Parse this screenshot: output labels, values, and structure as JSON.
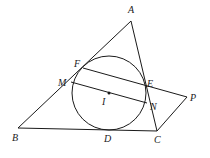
{
  "diagram": {
    "points": {
      "A": {
        "label": "A",
        "x": 131,
        "y": 21
      },
      "B": {
        "label": "B",
        "x": 18,
        "y": 128
      },
      "C": {
        "label": "C",
        "x": 157,
        "y": 131
      },
      "D": {
        "label": "D",
        "x": 112,
        "y": 130
      },
      "E": {
        "label": "E",
        "x": 146,
        "y": 86
      },
      "F": {
        "label": "F",
        "x": 83,
        "y": 68
      },
      "M": {
        "label": "M",
        "x": 71,
        "y": 82
      },
      "N": {
        "label": "N",
        "x": 147,
        "y": 103
      },
      "I": {
        "label": "I",
        "x": 109,
        "y": 93
      },
      "P": {
        "label": "P",
        "x": 187,
        "y": 97
      }
    },
    "circle": {
      "center": "I",
      "cx": 109,
      "cy": 93,
      "r": 37
    },
    "segments": [
      "AB",
      "AC",
      "BC",
      "FP",
      "MN",
      "PC"
    ],
    "labels": {
      "A": "A",
      "B": "B",
      "C": "C",
      "D": "D",
      "E": "E",
      "F": "F",
      "M": "M",
      "N": "N",
      "I": "I",
      "P": "P"
    }
  }
}
